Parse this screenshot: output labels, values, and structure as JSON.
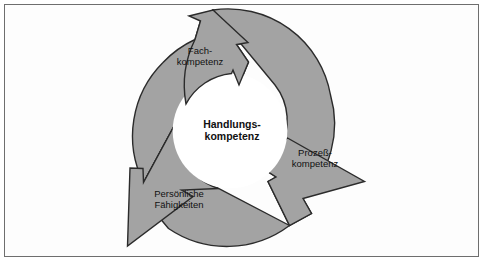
{
  "figure": {
    "background_color": "#fdfdfd",
    "frame_border_color": "#6e6e6e"
  },
  "diagram": {
    "type": "cyclical-arrow-ring",
    "center_label": {
      "line1": "Handlungs-",
      "line2": "kompetenz"
    },
    "ring": {
      "fill_color": "#a3a3a3",
      "outline_color": "#2b2b2b",
      "hole_fill_color": "#ffffff",
      "center_x": 230,
      "center_y": 131,
      "outer_radius": 104,
      "inner_radius": 58
    },
    "segments": [
      {
        "id": "fach",
        "line1": "Fach-",
        "line2": "kompetenz",
        "position": "top",
        "arrow_direction": "up"
      },
      {
        "id": "prozess",
        "line1": "Prozeß-",
        "line2": "kompetenz",
        "position": "lower-right",
        "arrow_direction": "lower-right"
      },
      {
        "id": "persoenliche",
        "line1": "Persönliche",
        "line2": "Fähigkeiten",
        "position": "lower-left",
        "arrow_direction": "lower-left"
      }
    ]
  }
}
